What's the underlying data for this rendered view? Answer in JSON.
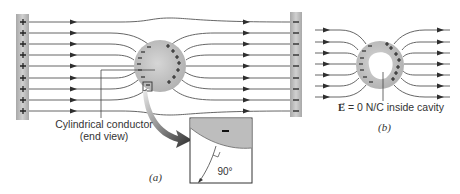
{
  "figure": {
    "part_a": {
      "caption": "(a)",
      "conductor_label_line1": "Cylindrical conductor",
      "conductor_label_line2": "(end view)",
      "left_plate_charge": "+",
      "right_plate_charge": "−",
      "inset": {
        "surface_charge": "−",
        "angle_label": "90°"
      }
    },
    "part_b": {
      "caption": "(b)",
      "field_symbol": "E",
      "field_statement": "= 0 N/C inside cavity"
    },
    "colors": {
      "plate": "#b5b5b5",
      "conductor": "#c8c8c8",
      "field_line": "#555555",
      "arrow": "#2e2e2e"
    }
  }
}
